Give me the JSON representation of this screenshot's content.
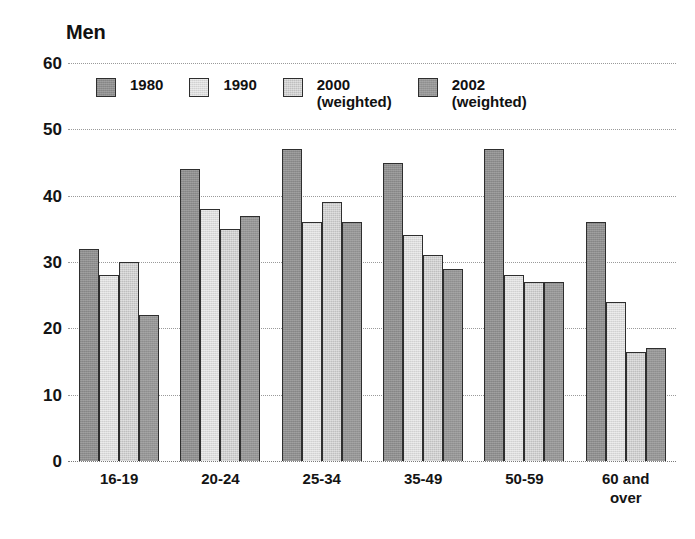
{
  "chart_data": {
    "type": "bar",
    "title": "Men",
    "xlabel": "",
    "ylabel": "",
    "ylim": [
      0,
      60
    ],
    "ytick_step": 10,
    "yticks": [
      "60",
      "50",
      "40",
      "30",
      "20",
      "10",
      "0"
    ],
    "grid": true,
    "legend_position": "top-inside",
    "categories": [
      "16-19",
      "20-24",
      "25-34",
      "35-49",
      "50-59",
      "60 and\nover"
    ],
    "series": [
      {
        "name": "1980",
        "color": "#8e8e8e",
        "values": [
          32,
          44,
          47,
          45,
          47,
          36
        ]
      },
      {
        "name": "1990",
        "color": "#dcdcdc",
        "values": [
          28,
          38,
          36,
          34,
          28,
          24
        ]
      },
      {
        "name": "2000\n(weighted)",
        "color": "#cfcfcf",
        "values": [
          30,
          35,
          39,
          31,
          27,
          16.5
        ]
      },
      {
        "name": "2002\n(weighted)",
        "color": "#969696",
        "values": [
          22,
          37,
          36,
          29,
          27,
          17
        ]
      }
    ]
  },
  "legend": {
    "entries": [
      {
        "label": "1980"
      },
      {
        "label": "1990"
      },
      {
        "label": "2000\n(weighted)"
      },
      {
        "label": "2002\n(weighted)"
      }
    ]
  },
  "colors": {
    "background": "#ffffff",
    "text": "#111111",
    "gridline": "#9a9a9a",
    "bar_outline": "#2e2e2e"
  }
}
